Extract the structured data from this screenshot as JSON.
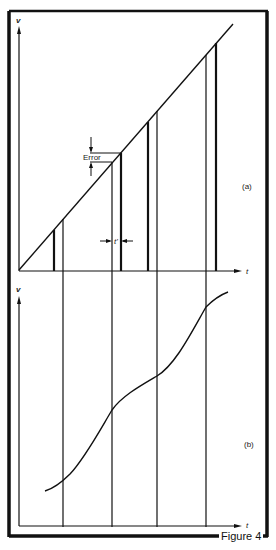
{
  "figure": {
    "caption": "Figure 4",
    "colors": {
      "ink": "#111111",
      "background": "#ffffff"
    }
  },
  "panel_a": {
    "label": "(a)",
    "y_axis_label": "v",
    "x_axis_label": "t",
    "error_label": "Error",
    "interval_label": "t'",
    "ramp": {
      "from": [
        19,
        270
      ],
      "to": [
        233,
        24
      ]
    },
    "samples_thin_x": [
      63,
      112,
      157,
      206
    ],
    "samples_thick_x": [
      54,
      121,
      148,
      216
    ]
  },
  "panel_b": {
    "label": "(b)",
    "y_axis_label": "v",
    "x_axis_label": "t",
    "curve_points": [
      [
        45,
        491
      ],
      [
        63,
        480
      ],
      [
        90,
        452
      ],
      [
        112,
        409
      ],
      [
        135,
        390
      ],
      [
        157,
        376
      ],
      [
        180,
        350
      ],
      [
        206,
        306
      ],
      [
        228,
        292
      ]
    ]
  }
}
